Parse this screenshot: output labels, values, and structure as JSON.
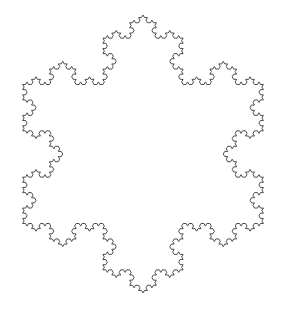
{
  "figure": {
    "type": "koch-snowflake",
    "iterations": 4,
    "stroke_color": "#3a3a3a",
    "background": "#ffffff",
    "stroke_width": 0.9,
    "base_triangle": {
      "top": [
        143,
        15
      ],
      "bottom_right": [
        263.4,
        223.5
      ],
      "bottom_left": [
        22.6,
        223.5
      ]
    }
  }
}
